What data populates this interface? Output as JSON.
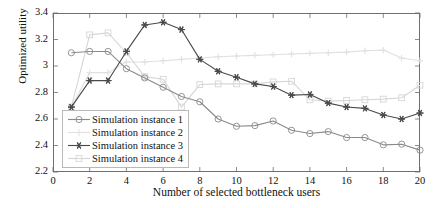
{
  "chart_data": {
    "type": "line",
    "title": "",
    "xlabel": "Number of selected bottleneck users",
    "ylabel": "Optimized utility",
    "xlim": [
      0,
      20
    ],
    "ylim": [
      2.2,
      3.4
    ],
    "xticks": [
      0,
      2,
      4,
      6,
      8,
      10,
      12,
      14,
      16,
      18,
      20
    ],
    "yticks": [
      "2.2",
      "2.4",
      "2.6",
      "2.8",
      "3",
      "3.2",
      "3.4"
    ],
    "grid": false,
    "legend_position": "lower-left-inside",
    "x": [
      1,
      2,
      3,
      4,
      5,
      6,
      7,
      8,
      9,
      10,
      11,
      12,
      13,
      14,
      15,
      16,
      17,
      18,
      19,
      20
    ],
    "series": [
      {
        "name": "Simulation instance 1",
        "marker": "circle",
        "color": "#8a8a8a",
        "values": [
          3.1,
          3.11,
          3.11,
          2.98,
          2.91,
          2.84,
          2.77,
          2.73,
          2.6,
          2.545,
          2.55,
          2.585,
          2.515,
          2.49,
          2.505,
          2.46,
          2.46,
          2.405,
          2.41,
          2.365
        ]
      },
      {
        "name": "Simulation instance 2",
        "marker": "plus",
        "color": "#e0e0e0",
        "values": [
          2.69,
          2.95,
          2.95,
          3.03,
          3.03,
          3.04,
          3.05,
          3.06,
          3.07,
          3.075,
          3.08,
          3.085,
          3.09,
          3.095,
          3.1,
          3.105,
          3.115,
          3.12,
          3.06,
          3.04
        ]
      },
      {
        "name": "Simulation instance 3",
        "marker": "star",
        "color": "#4a4a4a",
        "values": [
          2.69,
          2.89,
          2.89,
          3.11,
          3.31,
          3.33,
          3.275,
          3.05,
          2.96,
          2.915,
          2.865,
          2.845,
          2.78,
          2.785,
          2.72,
          2.69,
          2.68,
          2.63,
          2.6,
          2.645
        ]
      },
      {
        "name": "Simulation instance 4",
        "marker": "square",
        "color": "#d6d6d6",
        "values": [
          2.69,
          3.235,
          3.25,
          3.1,
          2.92,
          2.9,
          2.69,
          2.86,
          2.865,
          2.865,
          2.865,
          2.88,
          2.885,
          2.745,
          2.735,
          2.74,
          2.745,
          2.75,
          2.76,
          2.855
        ]
      }
    ]
  },
  "legend": {
    "items": [
      {
        "label": "Simulation instance 1"
      },
      {
        "label": "Simulation instance 2"
      },
      {
        "label": "Simulation instance 3"
      },
      {
        "label": "Simulation instance 4"
      }
    ]
  }
}
